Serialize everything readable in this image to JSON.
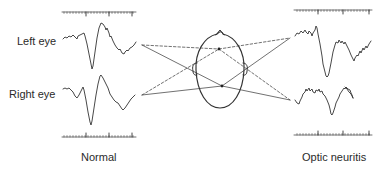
{
  "labels": {
    "left_eye": "Left eye",
    "right_eye": "Right eye",
    "normal": "Normal",
    "optic_neuritis": "Optic neuritis"
  },
  "panels": [
    {
      "name": "Normal",
      "traces": [
        {
          "eye": "Left eye",
          "description": "Normal VEP with prominent negative dip followed by large positive peak"
        },
        {
          "eye": "Right eye",
          "description": "Normal VEP with prominent negative dip followed by large positive peak"
        }
      ]
    },
    {
      "name": "Optic neuritis",
      "traces": [
        {
          "eye": "Left eye",
          "description": "Delayed, broadened deflection with large trough"
        },
        {
          "eye": "Right eye",
          "description": "Low-amplitude, noisy, delayed response"
        }
      ]
    }
  ],
  "colors": {
    "line": "#333333",
    "dashed": "#555555",
    "text": "#2a2a2a"
  }
}
